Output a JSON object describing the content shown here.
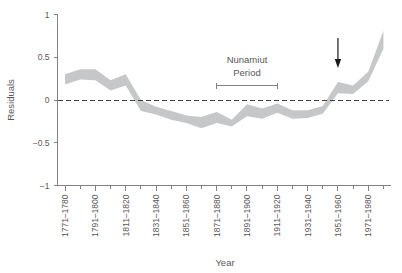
{
  "chart_data": {
    "type": "area",
    "title": "",
    "xlabel": "Year",
    "ylabel": "Residuals",
    "ylim": [
      -1,
      1
    ],
    "yticks": [
      -1,
      -0.5,
      0,
      0.5,
      1
    ],
    "ytick_labels": [
      "-1",
      "-0.5",
      "0",
      "0.5",
      "1"
    ],
    "grid": false,
    "legend": "none",
    "zero_reference_line": 0,
    "categories": [
      "1771-1780",
      "1781-1790",
      "1791-1800",
      "1801-1810",
      "1811-1820",
      "1821-1830",
      "1831-1840",
      "1841-1850",
      "1851-1860",
      "1861-1870",
      "1871-1880",
      "1881-1890",
      "1891-1900",
      "1901-1910",
      "1911-1920",
      "1921-1930",
      "1931-1940",
      "1941-1950",
      "1951-1960",
      "1961-1970",
      "1971-1980",
      "1981-1990"
    ],
    "xtick_labels_shown": [
      "1771–1780",
      "1791–1800",
      "1811–1820",
      "1831–1840",
      "1851–1860",
      "1871–1880",
      "1891–1900",
      "1911–1920",
      "1931–1940",
      "1951–1960",
      "1971–1980"
    ],
    "series": [
      {
        "name": "Residuals upper bound",
        "values": [
          0.3,
          0.36,
          0.36,
          0.23,
          0.3,
          0.0,
          -0.08,
          -0.13,
          -0.18,
          -0.2,
          -0.14,
          -0.23,
          -0.05,
          -0.1,
          -0.04,
          -0.12,
          -0.12,
          -0.07,
          0.21,
          0.17,
          0.33,
          0.81
        ]
      },
      {
        "name": "Residuals lower bound",
        "values": [
          0.18,
          0.24,
          0.23,
          0.11,
          0.17,
          -0.13,
          -0.17,
          -0.23,
          -0.27,
          -0.33,
          -0.27,
          -0.31,
          -0.19,
          -0.22,
          -0.15,
          -0.22,
          -0.21,
          -0.16,
          0.08,
          0.07,
          0.22,
          0.6
        ]
      }
    ],
    "band_fill_color": "#c6c7c8",
    "axis_color": "#808285",
    "text_color": "#58585a",
    "annotations": [
      {
        "name": "nunamiut-period",
        "label_line1": "Nunamiut",
        "label_line2": "Period",
        "range_start_category": "1871-1880",
        "range_end_category": "1911-1920"
      },
      {
        "name": "arrow-marker",
        "label": "",
        "points_at_category": "1951-1960",
        "color": "#1a1a1a"
      }
    ]
  },
  "figure": {
    "y_axis_title": "Residuals",
    "x_axis_title": "Year"
  }
}
